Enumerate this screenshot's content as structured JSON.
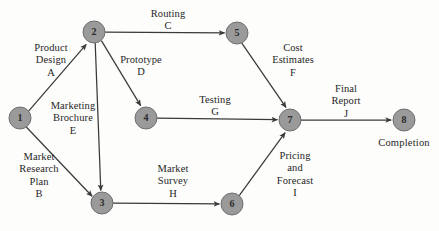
{
  "diagram": {
    "background_color": "#fdfdfc",
    "node_fill_color": "#9a9a9a",
    "node_stroke_color": "#6f6f6f",
    "edge_color": "#3a3a3a",
    "nodes": [
      {
        "id": "1",
        "label": "1",
        "x": 20,
        "y": 118,
        "r": 11
      },
      {
        "id": "2",
        "label": "2",
        "x": 94,
        "y": 32,
        "r": 11
      },
      {
        "id": "3",
        "label": "3",
        "x": 102,
        "y": 203,
        "r": 11
      },
      {
        "id": "4",
        "label": "4",
        "x": 146,
        "y": 118,
        "r": 11
      },
      {
        "id": "5",
        "label": "5",
        "x": 237,
        "y": 33,
        "r": 11
      },
      {
        "id": "6",
        "label": "6",
        "x": 232,
        "y": 204,
        "r": 11
      },
      {
        "id": "7",
        "label": "7",
        "x": 290,
        "y": 120,
        "r": 11
      },
      {
        "id": "8",
        "label": "8",
        "x": 404,
        "y": 120,
        "r": 11
      }
    ],
    "edges": [
      {
        "id": "edge-1-2",
        "from": "1",
        "to": "2",
        "activity_code": "A",
        "label": "Product\nDesign\nA",
        "label_x": 22,
        "label_y": 42,
        "label_w": 58,
        "label_align": "center"
      },
      {
        "id": "edge-2-5",
        "from": "2",
        "to": "5",
        "activity_code": "C",
        "label": "Routing\nC",
        "label_x": 139,
        "label_y": 8,
        "label_w": 58,
        "label_align": "center"
      },
      {
        "id": "edge-2-4",
        "from": "2",
        "to": "4",
        "activity_code": "D",
        "label": "Prototype\nD",
        "label_x": 112,
        "label_y": 54,
        "label_w": 58,
        "label_align": "center"
      },
      {
        "id": "edge-2-3",
        "from": "2",
        "to": "3",
        "activity_code": "E",
        "label": "Marketing\nBrochure\nE",
        "label_x": 44,
        "label_y": 100,
        "label_w": 58,
        "label_align": "center"
      },
      {
        "id": "edge-1-3",
        "from": "1",
        "to": "3",
        "activity_code": "B",
        "label": "Market\nResearch\nPlan\nB",
        "label_x": 11,
        "label_y": 151,
        "label_w": 56,
        "label_align": "center"
      },
      {
        "id": "edge-4-7",
        "from": "4",
        "to": "7",
        "activity_code": "G",
        "label": "Testing\nG",
        "label_x": 189,
        "label_y": 94,
        "label_w": 52,
        "label_align": "center"
      },
      {
        "id": "edge-5-7",
        "from": "5",
        "to": "7",
        "activity_code": "F",
        "label": "Cost\nEstimates\nF",
        "label_x": 262,
        "label_y": 42,
        "label_w": 62,
        "label_align": "center"
      },
      {
        "id": "edge-3-6",
        "from": "3",
        "to": "6",
        "activity_code": "H",
        "label": "Market\nSurvey\nH",
        "label_x": 144,
        "label_y": 163,
        "label_w": 58,
        "label_align": "center"
      },
      {
        "id": "edge-6-7",
        "from": "6",
        "to": "7",
        "activity_code": "I",
        "label": "Pricing\nand\nForecast\nI",
        "label_x": 266,
        "label_y": 150,
        "label_w": 58,
        "label_align": "center"
      },
      {
        "id": "edge-7-8",
        "from": "7",
        "to": "8",
        "activity_code": "J",
        "label": "Final\nReport\nJ",
        "label_x": 321,
        "label_y": 83,
        "label_w": 50,
        "label_align": "center"
      }
    ],
    "annotations": [
      {
        "id": "completion",
        "text": "Completion",
        "x": 369,
        "y": 137,
        "w": 70
      }
    ]
  }
}
